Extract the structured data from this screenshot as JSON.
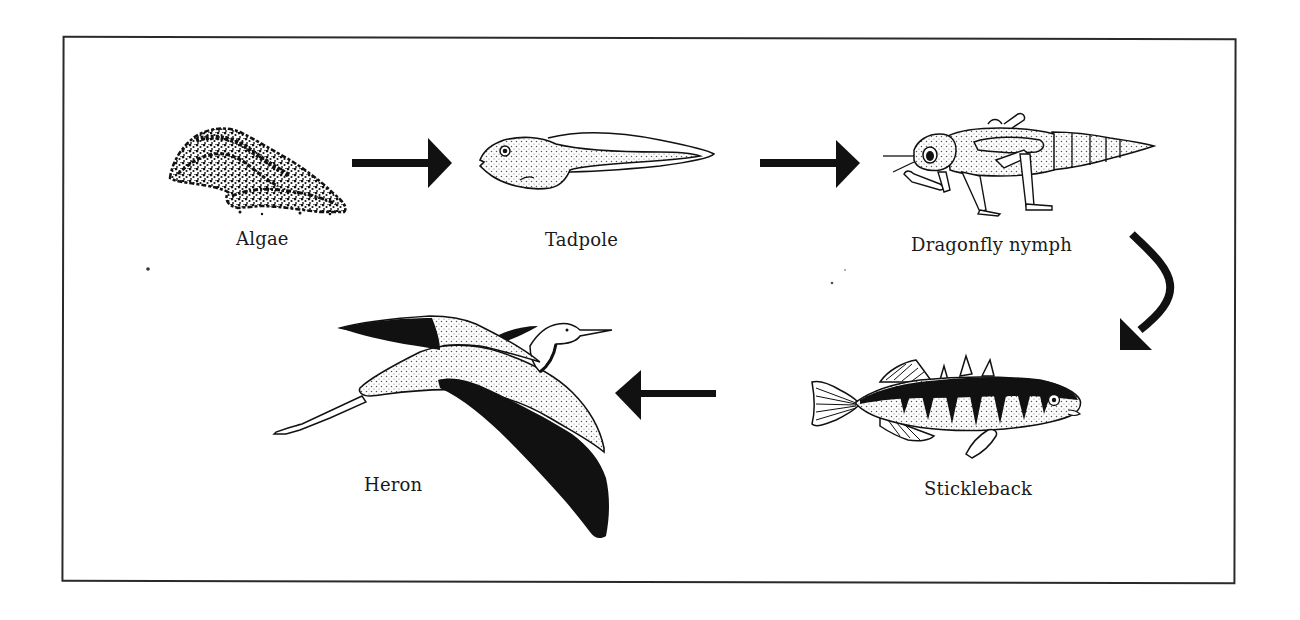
{
  "diagram": {
    "type": "food-chain",
    "colors": {
      "ink": "#111111",
      "frame": "#2a2a2a",
      "background": "#ffffff",
      "stipple": "#555555"
    },
    "organisms": [
      {
        "id": "algae",
        "label": "Algae",
        "icon": "algae-icon"
      },
      {
        "id": "tadpole",
        "label": "Tadpole",
        "icon": "tadpole-icon"
      },
      {
        "id": "dragonfly_nymph",
        "label": "Dragonfly nymph",
        "icon": "dragonfly-nymph-icon"
      },
      {
        "id": "stickleback",
        "label": "Stickleback",
        "icon": "stickleback-icon"
      },
      {
        "id": "heron",
        "label": "Heron",
        "icon": "heron-icon"
      }
    ],
    "arrows": [
      {
        "from": "Algae",
        "to": "Tadpole",
        "direction": "right"
      },
      {
        "from": "Tadpole",
        "to": "Dragonfly nymph",
        "direction": "right"
      },
      {
        "from": "Dragonfly nymph",
        "to": "Stickleback",
        "direction": "curved-down"
      },
      {
        "from": "Stickleback",
        "to": "Heron",
        "direction": "left"
      }
    ]
  }
}
